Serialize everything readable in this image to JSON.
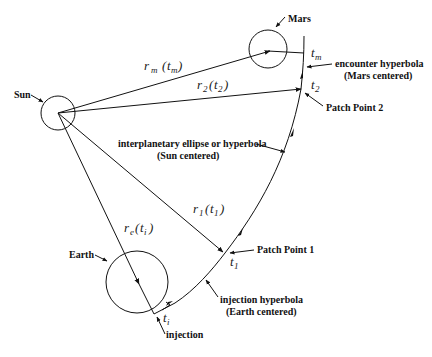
{
  "diagram": {
    "bodies": {
      "sun": {
        "label": "Sun",
        "cx": 58,
        "cy": 113,
        "r": 17
      },
      "earth": {
        "label": "Earth",
        "cx": 137,
        "cy": 282,
        "r": 31
      },
      "mars": {
        "label": "Mars",
        "cx": 268,
        "cy": 49,
        "r": 19
      }
    },
    "vectors": {
      "rm": {
        "base": "r",
        "sub": "m",
        "arg": "t",
        "argsub": "m"
      },
      "r2": {
        "base": "r",
        "sub": "2",
        "arg": "t",
        "argsub": "2"
      },
      "r1": {
        "base": "r",
        "sub": "1",
        "arg": "t",
        "argsub": "1"
      },
      "re": {
        "base": "r",
        "sub": "e",
        "arg": "t",
        "argsub": "i"
      }
    },
    "times": {
      "tm": {
        "base": "t",
        "sub": "m"
      },
      "t2": {
        "base": "t",
        "sub": "2"
      },
      "t1": {
        "base": "t",
        "sub": "1"
      },
      "ti": {
        "base": "t",
        "sub": "i"
      }
    },
    "annotations": {
      "encounter_line1": "encounter hyperbola",
      "encounter_line2": "(Mars centered)",
      "patch2": "Patch Point 2",
      "interplanetary_line1": "interplanetary ellipse or hyperbola",
      "interplanetary_line2": "(Sun centered)",
      "patch1": "Patch Point 1",
      "injection_hyp_line1": "injection hyperbola",
      "injection_hyp_line2": "(Earth centered)",
      "injection": "injection"
    },
    "paren_open": "(",
    "paren_close": ")"
  }
}
